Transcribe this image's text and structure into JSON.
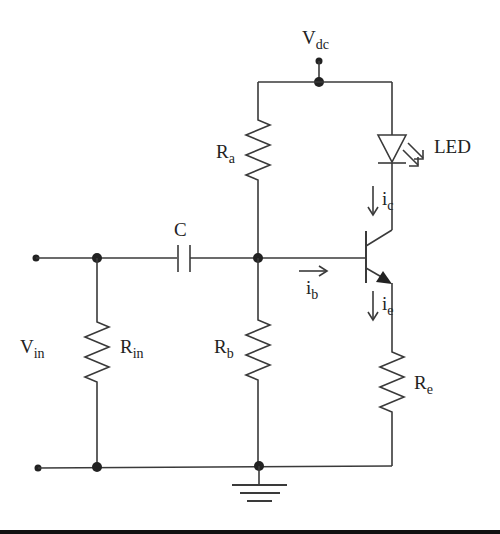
{
  "labels": {
    "vdc": {
      "main": "V",
      "sub": "dc"
    },
    "ra": {
      "main": "R",
      "sub": "a"
    },
    "led": "LED",
    "ic": {
      "main": "i",
      "sub": "c"
    },
    "c": "C",
    "ib": {
      "main": "i",
      "sub": "b"
    },
    "ie": {
      "main": "i",
      "sub": "e"
    },
    "vin": {
      "main": "V",
      "sub": "in"
    },
    "rin": {
      "main": "R",
      "sub": "in"
    },
    "rb": {
      "main": "R",
      "sub": "b"
    },
    "re": {
      "main": "R",
      "sub": "e"
    }
  },
  "colors": {
    "wire": "#3a3a3a",
    "background": "#ffffff",
    "bottom_bar": "#111111"
  }
}
